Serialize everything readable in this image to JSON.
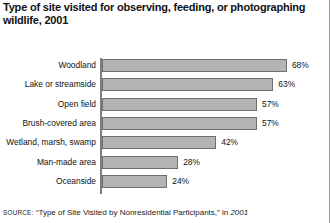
{
  "chart_data": {
    "type": "bar",
    "orientation": "horizontal",
    "title": "Type of site visited for observing, feeding, or photographing wildlife, 2001",
    "xlabel": "",
    "ylabel": "",
    "xlim": [
      0,
      75
    ],
    "grid": false,
    "legend": null,
    "value_suffix": "%",
    "categories": [
      "Woodland",
      "Lake or streamside",
      "Open field",
      "Brush-covered area",
      "Wetland, marsh, swamp",
      "Man-made area",
      "Oceanside"
    ],
    "values": [
      68,
      63,
      57,
      57,
      42,
      28,
      24
    ],
    "data_labels": [
      "68%",
      "63%",
      "57%",
      "57%",
      "42%",
      "28%",
      "24%"
    ],
    "colors": {
      "bar_fill": "#b4b4b4",
      "bar_border": "#6f6f6f",
      "axis": "#7d7d7d",
      "text": "#111111",
      "background": "#ffffff"
    }
  },
  "source": {
    "prefix": "SOURCE:",
    "quoted_title": "“Type of Site Visited by Nonresidential Participants,”",
    "connector": "in",
    "publication": "2001"
  }
}
